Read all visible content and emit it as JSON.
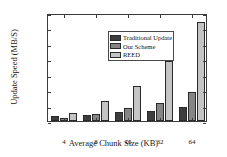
{
  "chart_data": {
    "type": "bar",
    "title": "",
    "xlabel": "Average Chunk Size (KB)",
    "ylabel": "Update Speed (MB/S)",
    "categories": [
      "4",
      "8",
      "16",
      "32",
      "64"
    ],
    "series": [
      {
        "name": "Traditional Update",
        "color": "#3d3d3d",
        "values": [
          15,
          20,
          28,
          34,
          44
        ]
      },
      {
        "name": "Our Scheme",
        "color": "#858585",
        "values": [
          10,
          22,
          42,
          58,
          94
        ]
      },
      {
        "name": "REED",
        "color": "#c4c4c4",
        "values": [
          25,
          65,
          115,
          195,
          322
        ]
      }
    ],
    "ylim": [
      0,
      350
    ],
    "yticks": [
      "0",
      "50",
      "100",
      "150",
      "200",
      "250",
      "300",
      "350"
    ],
    "ytick_values": [
      0,
      50,
      100,
      150,
      200,
      250,
      300,
      350
    ],
    "grid": false,
    "legend_position": "top-left",
    "axis_color": "#3b3b3b"
  },
  "legend": {
    "entries": [
      {
        "label": "Traditional Update"
      },
      {
        "label": "Our Scheme"
      },
      {
        "label": "REED"
      }
    ]
  }
}
